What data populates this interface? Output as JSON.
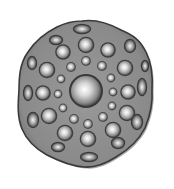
{
  "image": {
    "subject": "3D rendered gray disc with radially arranged spherical bumps",
    "background": "#ffffff",
    "disc": {
      "color": "#8a8a8a",
      "edge_color": "#3a3a3a",
      "outline": "M82,21 C96,19 110,24 121,30 C133,35 140,40 146,52 C151,62 153,76 152,90 C153,104 150,116 145,128 C139,140 128,150 116,157 C105,164 95,168 84,167 C71,166 59,161 47,155 C36,149 27,141 22,129 C17,117 18,103 19,90 C19,76 20,63 28,52 C35,41 45,33 57,27 C65,23 73,21 82,21 Z"
    },
    "center_sphere": {
      "cx": 86,
      "cy": 91,
      "r": 15
    },
    "inner_dots": [
      {
        "cx": 86,
        "cy": 61,
        "r": 4
      },
      {
        "cx": 71,
        "cy": 67,
        "r": 4
      },
      {
        "cx": 102,
        "cy": 66,
        "r": 4
      },
      {
        "cx": 61,
        "cy": 79,
        "r": 3.5
      },
      {
        "cx": 111,
        "cy": 78,
        "r": 3.5
      },
      {
        "cx": 58,
        "cy": 94,
        "r": 3.5
      },
      {
        "cx": 113,
        "cy": 92,
        "r": 3.5
      },
      {
        "cx": 63,
        "cy": 108,
        "r": 3.5
      },
      {
        "cx": 112,
        "cy": 106,
        "r": 3.5
      },
      {
        "cx": 74,
        "cy": 119,
        "r": 4
      },
      {
        "cx": 103,
        "cy": 117,
        "r": 4
      },
      {
        "cx": 88,
        "cy": 124,
        "r": 4
      }
    ],
    "mid_spheres": [
      {
        "cx": 86,
        "cy": 45,
        "r": 7
      },
      {
        "cx": 63,
        "cy": 52,
        "r": 6.5
      },
      {
        "cx": 108,
        "cy": 50,
        "r": 6.5
      },
      {
        "cx": 47,
        "cy": 70,
        "r": 7
      },
      {
        "cx": 125,
        "cy": 68,
        "r": 7
      },
      {
        "cx": 43,
        "cy": 93,
        "r": 6.5
      },
      {
        "cx": 128,
        "cy": 92,
        "r": 6.5
      },
      {
        "cx": 49,
        "cy": 116,
        "r": 7
      },
      {
        "cx": 127,
        "cy": 113,
        "r": 7
      },
      {
        "cx": 65,
        "cy": 133,
        "r": 7
      },
      {
        "cx": 113,
        "cy": 130,
        "r": 7
      },
      {
        "cx": 88,
        "cy": 139,
        "r": 7
      }
    ],
    "rim_pockets": [
      {
        "cx": 82,
        "cy": 29,
        "rx": 8,
        "ry": 4
      },
      {
        "cx": 56,
        "cy": 40,
        "rx": 6,
        "ry": 4
      },
      {
        "cx": 130,
        "cy": 46,
        "rx": 5,
        "ry": 6
      },
      {
        "cx": 32,
        "cy": 63,
        "rx": 4,
        "ry": 6
      },
      {
        "cx": 142,
        "cy": 87,
        "rx": 4,
        "ry": 8
      },
      {
        "cx": 28,
        "cy": 93,
        "rx": 4,
        "ry": 7
      },
      {
        "cx": 33,
        "cy": 120,
        "rx": 5,
        "ry": 7
      },
      {
        "cx": 137,
        "cy": 122,
        "rx": 5,
        "ry": 7
      },
      {
        "cx": 58,
        "cy": 147,
        "rx": 6,
        "ry": 4
      },
      {
        "cx": 118,
        "cy": 143,
        "rx": 6,
        "ry": 5
      },
      {
        "cx": 89,
        "cy": 157,
        "rx": 8,
        "ry": 4
      },
      {
        "cx": 145,
        "cy": 66,
        "rx": 3,
        "ry": 5
      }
    ]
  }
}
